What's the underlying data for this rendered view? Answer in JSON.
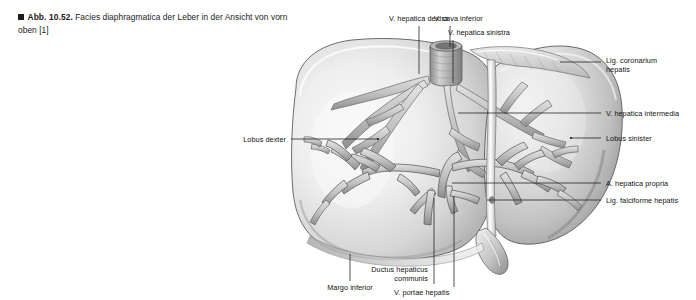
{
  "caption": {
    "bullet": "square-bullet",
    "number": "Abb. 10.52.",
    "text": "Facies diaphragmatica der Leber in der Ansicht von vorn oben [1]"
  },
  "figure": {
    "organ": "Leber (Hepar)",
    "view": "Facies diaphragmatica, Ansicht von vorn oben",
    "render_style": "grayscale-halftone-anatomical-illustration",
    "colors": {
      "page_background": "#ffffff",
      "parenchyma_light": "#f2f2f2",
      "parenchyma_mid": "#d8d8d8",
      "parenchyma_dark": "#9a9a9a",
      "vessel_fill": "#c9c9c9",
      "vessel_stroke": "#6e6e6e",
      "outline": "#4a4a4a",
      "leader_line": "#1a1a1a",
      "text": "#121212"
    }
  },
  "labels": [
    {
      "id": "v-hepatica-dextra",
      "text": "V. hepatica dextra",
      "align": "right",
      "x": 362,
      "y": 14,
      "w": 86
    },
    {
      "id": "v-cava-inferior",
      "text": "V. cava inferior",
      "align": "left",
      "x": 434,
      "y": 14,
      "w": 86
    },
    {
      "id": "v-hepatica-sinistra",
      "text": "V. hepatica sinistra",
      "align": "left",
      "x": 448,
      "y": 28,
      "w": 96
    },
    {
      "id": "lig-coronarium-hepatis",
      "text": "Lig. coronarium\nhepatis",
      "align": "left",
      "x": 606,
      "y": 56,
      "w": 88
    },
    {
      "id": "v-hepatica-intermedia",
      "text": "V. hepatica intermedia",
      "align": "left",
      "x": 606,
      "y": 110,
      "w": 90
    },
    {
      "id": "lobus-sinister",
      "text": "Lobus sinister",
      "align": "left",
      "x": 606,
      "y": 135,
      "w": 80
    },
    {
      "id": "a-hepatica-propria",
      "text": "A. hepatica propria",
      "align": "left",
      "x": 606,
      "y": 179,
      "w": 86
    },
    {
      "id": "lig-falciforme-hepatis",
      "text": "Lig. falciforme hepatis",
      "align": "left",
      "x": 606,
      "y": 196,
      "w": 92
    },
    {
      "id": "lobus-dexter",
      "text": "Lobus dexter",
      "align": "right",
      "x": 218,
      "y": 136,
      "w": 68
    },
    {
      "id": "margo-inferior",
      "text": "Margo inferior",
      "align": "center",
      "x": 315,
      "y": 284,
      "w": 70
    },
    {
      "id": "ductus-hepaticus-communis",
      "text": "Ductus hepaticus\ncommunis",
      "align": "right",
      "x": 372,
      "y": 269,
      "w": 76
    },
    {
      "id": "v-portae-hepatis",
      "text": "V. portae hepatis",
      "align": "left",
      "x": 394,
      "y": 290,
      "w": 80
    }
  ],
  "leaders": [
    {
      "id": "leader-v-hepatica-dextra",
      "from": [
        419,
        26
      ],
      "to": [
        419,
        74
      ]
    },
    {
      "id": "leader-v-cava-inferior",
      "from": [
        450,
        26
      ],
      "to": [
        450,
        47
      ]
    },
    {
      "id": "leader-v-hepatica-sinistra",
      "from": [
        453,
        40
      ],
      "to": [
        453,
        83
      ]
    },
    {
      "id": "leader-lig-coronarium",
      "from": [
        601,
        62
      ],
      "to": [
        560,
        62
      ]
    },
    {
      "id": "leader-v-hepatica-intermedia",
      "from": [
        601,
        113
      ],
      "to": [
        458,
        113
      ]
    },
    {
      "id": "leader-lobus-sinister",
      "from": [
        601,
        138
      ],
      "to": [
        571,
        138
      ]
    },
    {
      "id": "leader-a-hepatica-propria",
      "from": [
        601,
        183
      ],
      "to": [
        452,
        183
      ]
    },
    {
      "id": "leader-lig-falciforme",
      "from": [
        601,
        200
      ],
      "to": [
        487,
        200
      ]
    },
    {
      "id": "leader-lobus-dexter",
      "from": [
        291,
        139
      ],
      "to": [
        378,
        139
      ]
    },
    {
      "id": "leader-margo-inferior",
      "from": [
        350,
        281
      ],
      "to": [
        350,
        254
      ]
    },
    {
      "id": "leader-ductus-hepaticus",
      "from": [
        434,
        284
      ],
      "to": [
        434,
        198
      ]
    },
    {
      "id": "leader-v-portae-hepatis",
      "from": [
        454,
        287
      ],
      "to": [
        454,
        196
      ]
    }
  ]
}
